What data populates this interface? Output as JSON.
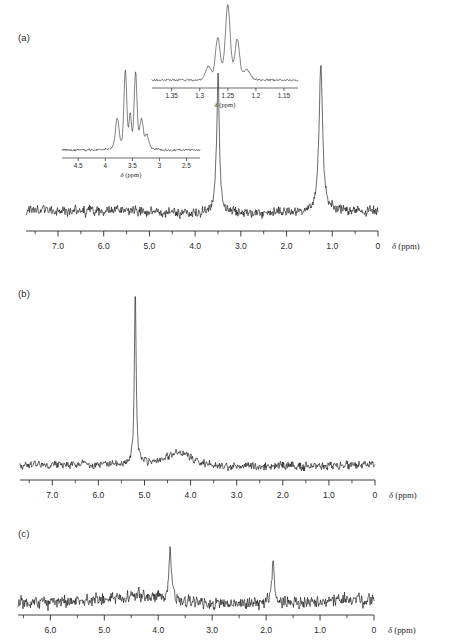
{
  "figure": {
    "type": "nmr-spectra-figure",
    "background": "#ffffff",
    "trace_color": "#0d0d0d",
    "axis_color": "#2b2b2b"
  },
  "panels": [
    {
      "id": "a",
      "label": "(a)",
      "axis_title": "δ (ppm)",
      "tick_labels": [
        "7.0",
        "6.0",
        "5.0",
        "4.0",
        "3.0",
        "2.0",
        "1.0",
        "0"
      ],
      "tick_values": [
        7.0,
        6.0,
        5.0,
        4.0,
        3.0,
        2.0,
        1.0,
        0.0
      ],
      "axis_min": 0.0,
      "axis_max": 7.7,
      "peaks": [
        {
          "ppm": 3.5,
          "height": 0.93,
          "width": 0.035,
          "label": "3.5"
        },
        {
          "ppm": 1.25,
          "height": 0.98,
          "width": 0.045,
          "label": "1.25"
        }
      ]
    },
    {
      "id": "b",
      "label": "(b)",
      "axis_title": "δ (ppm)",
      "tick_labels": [
        "7.0",
        "6.0",
        "5.0",
        "4.0",
        "3.0",
        "2.0",
        "1.0",
        "0"
      ],
      "tick_values": [
        7.0,
        6.0,
        5.0,
        4.0,
        3.0,
        2.0,
        1.0,
        0.0
      ],
      "axis_min": 0.0,
      "axis_max": 7.7,
      "peaks": [
        {
          "ppm": 5.2,
          "height": 1.0,
          "width": 0.022,
          "label": "5.2"
        },
        {
          "ppm": 4.25,
          "height": 0.075,
          "width": 0.38,
          "label": "4.25"
        }
      ]
    },
    {
      "id": "c",
      "label": "(c)",
      "axis_title": "δ (ppm)",
      "tick_labels": [
        "6.0",
        "5.0",
        "4.0",
        "3.0",
        "2.0",
        "1.0",
        "0"
      ],
      "tick_values": [
        6.0,
        5.0,
        4.0,
        3.0,
        2.0,
        1.0,
        0.0
      ],
      "axis_min": 0.0,
      "axis_max": 6.6,
      "peaks": [
        {
          "ppm": 3.78,
          "height": 0.95,
          "width": 0.028,
          "label": "3.78"
        },
        {
          "ppm": 1.87,
          "height": 0.86,
          "width": 0.026,
          "label": "1.87"
        },
        {
          "ppm": 4.3,
          "height": 0.12,
          "width": 0.33,
          "label": "4.3"
        }
      ]
    }
  ],
  "insets": [
    {
      "id": "inset-left",
      "parent_panel": "a",
      "axis_title": "δ (ppm)",
      "tick_labels": [
        "4.5",
        "4",
        "3.5",
        "3",
        "2.5"
      ],
      "tick_values": [
        4.5,
        4.0,
        3.5,
        3.0,
        2.5
      ],
      "axis_min": 2.25,
      "axis_max": 4.8,
      "multiplet_center": 3.52,
      "peaks": [
        {
          "ppm": 3.63,
          "height": 1.0
        },
        {
          "ppm": 3.44,
          "height": 0.99
        }
      ]
    },
    {
      "id": "inset-right",
      "parent_panel": "a",
      "axis_title": "δ (ppm)",
      "tick_labels": [
        "1.35",
        "1.3",
        "1.25",
        "1.2",
        "1.15"
      ],
      "tick_values": [
        1.35,
        1.3,
        1.25,
        1.2,
        1.15
      ],
      "axis_min": 1.125,
      "axis_max": 1.385,
      "multiplet_center": 1.25,
      "peaks": [
        {
          "ppm": 1.268,
          "height": 0.6
        },
        {
          "ppm": 1.25,
          "height": 1.0
        },
        {
          "ppm": 1.233,
          "height": 0.58
        }
      ]
    }
  ],
  "chart_data": {
    "type": "line",
    "title": "",
    "xlabel": "δ (ppm)",
    "ylabel": "",
    "grid": false,
    "legend": "none",
    "x_axis_inverted": true,
    "subplots": [
      {
        "name": "(a)",
        "xlim": [
          7.7,
          0.0
        ],
        "xticks": [
          7.0,
          6.0,
          5.0,
          4.0,
          3.0,
          2.0,
          1.0,
          0.0
        ],
        "xticklabels": [
          "7.0",
          "6.0",
          "5.0",
          "4.0",
          "3.0",
          "2.0",
          "1.0",
          "0"
        ],
        "series": [
          {
            "name": "1H NMR spectrum (a)",
            "peaks_ppm": [
              3.5,
              1.25
            ],
            "peaks_relative_intensity": [
              0.93,
              0.98
            ],
            "baseline_noise_amplitude": 0.05
          }
        ]
      },
      {
        "name": "(b)",
        "xlim": [
          7.7,
          0.0
        ],
        "xticks": [
          7.0,
          6.0,
          5.0,
          4.0,
          3.0,
          2.0,
          1.0,
          0.0
        ],
        "xticklabels": [
          "7.0",
          "6.0",
          "5.0",
          "4.0",
          "3.0",
          "2.0",
          "1.0",
          "0"
        ],
        "series": [
          {
            "name": "1H NMR spectrum (b)",
            "peaks_ppm": [
              5.2,
              4.25
            ],
            "peaks_relative_intensity": [
              1.0,
              0.075
            ],
            "baseline_noise_amplitude": 0.035
          }
        ]
      },
      {
        "name": "(c)",
        "xlim": [
          6.6,
          0.0
        ],
        "xticks": [
          6.0,
          5.0,
          4.0,
          3.0,
          2.0,
          1.0,
          0.0
        ],
        "xticklabels": [
          "6.0",
          "5.0",
          "4.0",
          "3.0",
          "2.0",
          "1.0",
          "0"
        ],
        "series": [
          {
            "name": "1H NMR spectrum (c)",
            "peaks_ppm": [
              4.3,
              3.78,
              1.87
            ],
            "peaks_relative_intensity": [
              0.12,
              0.95,
              0.86
            ],
            "baseline_noise_amplitude": 0.11
          }
        ]
      }
    ],
    "insets": [
      {
        "name": "inset of (a) at 3.5 ppm",
        "xlim": [
          4.8,
          2.25
        ],
        "xticks": [
          4.5,
          4.0,
          3.5,
          3.0,
          2.5
        ],
        "xticklabels": [
          "4.5",
          "4",
          "3.5",
          "3",
          "2.5"
        ],
        "peaks_ppm": [
          3.63,
          3.44
        ],
        "peaks_relative_intensity": [
          1.0,
          0.99
        ]
      },
      {
        "name": "inset of (a) at 1.25 ppm",
        "xlim": [
          1.385,
          1.125
        ],
        "xticks": [
          1.35,
          1.3,
          1.25,
          1.2,
          1.15
        ],
        "xticklabels": [
          "1.35",
          "1.3",
          "1.25",
          "1.2",
          "1.15"
        ],
        "peaks_ppm": [
          1.268,
          1.25,
          1.233
        ],
        "peaks_relative_intensity": [
          0.6,
          1.0,
          0.58
        ]
      }
    ]
  }
}
